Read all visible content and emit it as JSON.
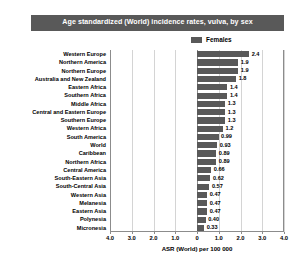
{
  "chart_data": {
    "type": "bar",
    "orientation": "horizontal",
    "title": "Age standardized (World) incidence rates, vulva, by sex",
    "xlabel": "ASR (World) per 100 000",
    "ylabel": "",
    "grid": true,
    "legend_position": "top-right",
    "xlim": [
      -4.0,
      4.0
    ],
    "xticks": [
      -4.0,
      -3.0,
      -2.0,
      -1.0,
      0,
      1.0,
      2.0,
      3.0,
      4.0
    ],
    "xticklabels": [
      "4.0",
      "3.0",
      "2.0",
      "1.0",
      "0",
      "1.0",
      "2.0",
      "3.0",
      "4.0"
    ],
    "categories": [
      "Western Europe",
      "Northern America",
      "Northern Europe",
      "Australia and New Zealand",
      "Eastern Africa",
      "Southern Africa",
      "Middle Africa",
      "Central and Eastern Europe",
      "Southern Europe",
      "Western Africa",
      "South America",
      "World",
      "Caribbean",
      "Northern Africa",
      "Central America",
      "South-Eastern Asia",
      "South-Central Asia",
      "Western Asia",
      "Melanesia",
      "Eastern Asia",
      "Polynesia",
      "Micronesia"
    ],
    "series": [
      {
        "name": "Females",
        "color": "#595959",
        "values": [
          2.4,
          1.9,
          1.9,
          1.8,
          1.4,
          1.4,
          1.3,
          1.3,
          1.3,
          1.2,
          0.99,
          0.93,
          0.89,
          0.89,
          0.66,
          0.62,
          0.57,
          0.47,
          0.47,
          0.47,
          0.4,
          0.33
        ],
        "value_labels": [
          "2.4",
          "1.9",
          "1.9",
          "1.8",
          "1.4",
          "1.4",
          "1.3",
          "1.3",
          "1.3",
          "1.2",
          "0.99",
          "0.93",
          "0.89",
          "0.89",
          "0.66",
          "0.62",
          "0.57",
          "0.47",
          "0.47",
          "0.47",
          "0.40",
          "0.33"
        ]
      }
    ]
  },
  "legend": {
    "entries": [
      {
        "label": "Females",
        "color": "#595959"
      }
    ]
  },
  "colors": {
    "bar": "#595959",
    "title_banner": "#595959",
    "title_text": "#ffffff",
    "gridline": "#d4d4d4",
    "axis": "#8c8c8c",
    "background": "#ffffff"
  }
}
